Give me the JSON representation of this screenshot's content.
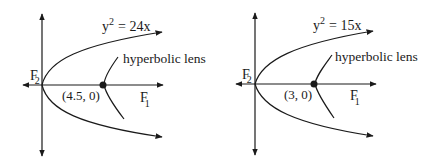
{
  "colors": {
    "ink": "#1a1a1a",
    "background": "#ffffff"
  },
  "diagrams": [
    {
      "equation_base": "y",
      "equation_exp": "2",
      "equation_rhs": "= 24x",
      "lens_label": "hyperbolic lens",
      "point_label": "(4.5, 0)",
      "focus_left": "F",
      "focus_left_sub": "2",
      "focus_right": "F",
      "focus_right_sub": "1"
    },
    {
      "equation_base": "y",
      "equation_exp": "2",
      "equation_rhs": "= 15x",
      "lens_label": "hyperbolic lens",
      "point_label": "(3, 0)",
      "focus_left": "F",
      "focus_left_sub": "2",
      "focus_right": "F",
      "focus_right_sub": "1"
    }
  ]
}
